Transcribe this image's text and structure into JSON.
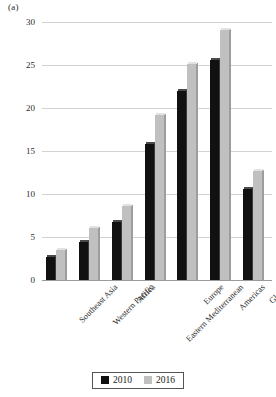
{
  "panel": {
    "label": "(a)"
  },
  "chart_data": {
    "type": "bar",
    "title": "",
    "subtitle": "",
    "xlabel": "",
    "ylabel": "",
    "ylim": [
      0,
      30
    ],
    "ytick_step": 5,
    "yticks": [
      "0",
      "5",
      "10",
      "15",
      "20",
      "25",
      "30"
    ],
    "grid": true,
    "legend_position": "bottom-center",
    "categories": [
      "Southeast Asia",
      "Western Pacific",
      "Africa",
      "Eastern Mediterranean",
      "Europe",
      "Americas",
      "Global"
    ],
    "series": [
      {
        "name": "2010",
        "color": "#111111",
        "values": [
          2.9,
          4.6,
          7.0,
          16.0,
          22.2,
          25.8,
          10.8
        ]
      },
      {
        "name": "2016",
        "color": "#c0c0c0",
        "values": [
          3.7,
          6.3,
          8.8,
          19.4,
          25.4,
          29.3,
          12.9
        ]
      }
    ]
  },
  "legend": {
    "items": [
      {
        "label": "2010",
        "swatch": "black-square-swatch"
      },
      {
        "label": "2016",
        "swatch": "gray-square-swatch"
      }
    ]
  }
}
